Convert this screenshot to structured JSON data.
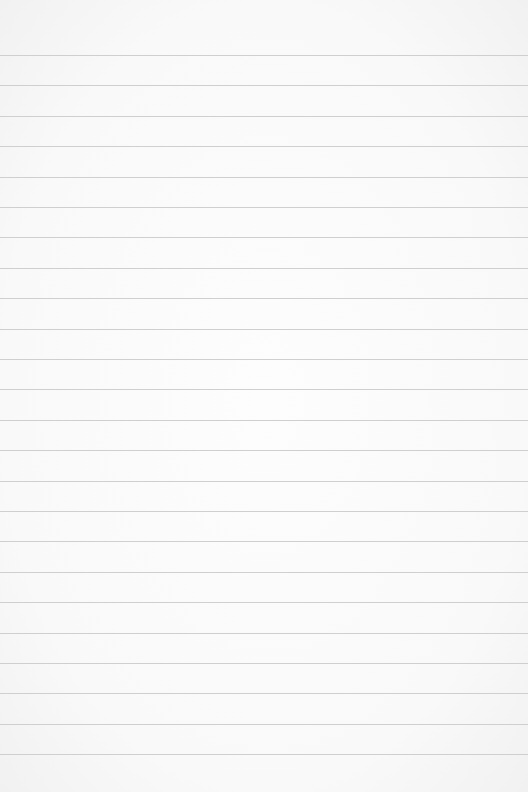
{
  "paper": {
    "description": "Blank lined notebook paper",
    "line_color": "#cfcfcf",
    "background_color": "#fbfbfb",
    "first_line_y": 55,
    "line_spacing": 30.4,
    "line_count": 24
  }
}
